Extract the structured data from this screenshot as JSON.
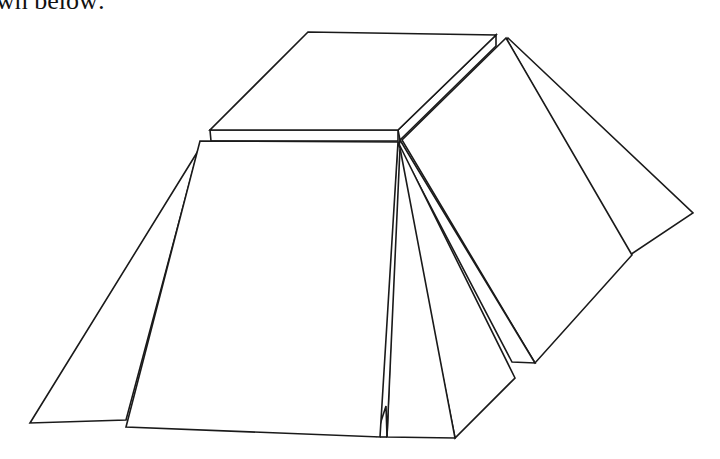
{
  "caption": {
    "text": "wn below:"
  },
  "figure": {
    "stroke_color": "#1a1a1a",
    "background": "#ffffff",
    "parts": [
      "top-slab",
      "left-triangle",
      "front-panel",
      "middle-wedges",
      "right-flap",
      "back-right-triangle"
    ]
  }
}
